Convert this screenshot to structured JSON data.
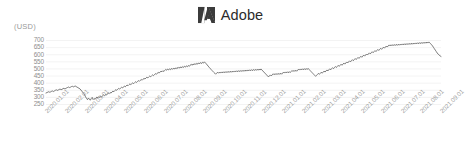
{
  "brand": {
    "logo_icon": "adobe-logo-icon",
    "name": "Adobe",
    "logo_color": "#3b3b3b",
    "text_color": "#2b2b2b"
  },
  "chart_data": {
    "type": "line",
    "title": "Adobe",
    "xlabel": "",
    "ylabel": "(USD)",
    "unit": "(USD)",
    "grid": true,
    "legend": "none",
    "line_color": "#595959",
    "grid_color": "#f0f0f0",
    "ylim": [
      250,
      700
    ],
    "yticks": [
      700,
      650,
      600,
      550,
      500,
      450,
      400,
      350,
      300,
      250
    ],
    "xticks": [
      "2020.01.01",
      "2020.02.01",
      "2020.03.01",
      "2020.04.01",
      "2020.05.01",
      "2020.06.01",
      "2020.07.01",
      "2020.08.01",
      "2020.09.01",
      "2020.10.01",
      "2020.11.01",
      "2020.12.01",
      "2021.01.01",
      "2021.02.01",
      "2021.03.01",
      "2021.04.01",
      "2021.05.01",
      "2021.06.01",
      "2021.07.01",
      "2021.08.01",
      "2021.09.01"
    ],
    "xlim": [
      "2020.01.01",
      "2021.09.30"
    ],
    "series": [
      {
        "name": "ADBE",
        "values": [
          331,
          334,
          337,
          340,
          336,
          339,
          343,
          345,
          341,
          346,
          350,
          353,
          349,
          352,
          356,
          358,
          354,
          357,
          361,
          364,
          360,
          363,
          367,
          370,
          373,
          369,
          372,
          376,
          378,
          374,
          377,
          380,
          376,
          372,
          368,
          364,
          360,
          352,
          344,
          336,
          328,
          316,
          304,
          292,
          284,
          296,
          288,
          280,
          292,
          300,
          285,
          292,
          286,
          295,
          303,
          297,
          305,
          300,
          308,
          303,
          312,
          318,
          312,
          320,
          316,
          324,
          330,
          326,
          334,
          330,
          338,
          344,
          340,
          348,
          354,
          350,
          357,
          363,
          358,
          365,
          371,
          366,
          373,
          379,
          374,
          381,
          387,
          382,
          389,
          395,
          390,
          396,
          402,
          397,
          404,
          410,
          405,
          412,
          418,
          413,
          420,
          426,
          421,
          428,
          434,
          429,
          436,
          442,
          437,
          444,
          450,
          445,
          452,
          458,
          453,
          460,
          467,
          462,
          470,
          476,
          471,
          478,
          485,
          480,
          488,
          482,
          490,
          497,
          491,
          499,
          493,
          501,
          495,
          503,
          497,
          505,
          499,
          507,
          501,
          510,
          504,
          512,
          506,
          515,
          508,
          517,
          511,
          519,
          513,
          522,
          516,
          524,
          518,
          527,
          533,
          526,
          535,
          529,
          538,
          531,
          540,
          534,
          543,
          536,
          545,
          538,
          547,
          541,
          550,
          543,
          536,
          528,
          520,
          512,
          505,
          497,
          490,
          483,
          476,
          470,
          463,
          470,
          477,
          470,
          478,
          471,
          479,
          472,
          480,
          473,
          481,
          474,
          482,
          475,
          483,
          476,
          484,
          477,
          485,
          478,
          486,
          479,
          487,
          480,
          488,
          481,
          489,
          482,
          490,
          483,
          491,
          484,
          492,
          485,
          493,
          486,
          494,
          487,
          495,
          488,
          496,
          489,
          497,
          490,
          498,
          491,
          499,
          492,
          500,
          493,
          486,
          479,
          472,
          465,
          458,
          451,
          444,
          451,
          458,
          451,
          459,
          466,
          459,
          467,
          460,
          468,
          461,
          469,
          462,
          470,
          463,
          471,
          478,
          471,
          479,
          472,
          480,
          473,
          481,
          474,
          482,
          489,
          482,
          490,
          483,
          491,
          484,
          492,
          499,
          492,
          500,
          493,
          501,
          494,
          502,
          495,
          503,
          496,
          504,
          497,
          490,
          483,
          476,
          469,
          462,
          455,
          448,
          455,
          462,
          469,
          462,
          470,
          477,
          470,
          478,
          485,
          478,
          486,
          493,
          486,
          494,
          501,
          494,
          502,
          509,
          502,
          510,
          517,
          510,
          518,
          525,
          518,
          526,
          533,
          526,
          534,
          541,
          534,
          542,
          549,
          542,
          550,
          557,
          550,
          558,
          565,
          558,
          566,
          573,
          566,
          574,
          581,
          574,
          582,
          589,
          582,
          590,
          597,
          590,
          598,
          605,
          598,
          606,
          613,
          606,
          614,
          621,
          614,
          622,
          629,
          622,
          630,
          637,
          630,
          638,
          645,
          638,
          646,
          653,
          646,
          654,
          661,
          654,
          662,
          669,
          662,
          670,
          663,
          671,
          664,
          672,
          665,
          673,
          666,
          674,
          667,
          675,
          668,
          676,
          669,
          677,
          670,
          678,
          671,
          679,
          672,
          680,
          673,
          681,
          674,
          682,
          675,
          683,
          676,
          684,
          677,
          685,
          678,
          686,
          679,
          687,
          680,
          688,
          681,
          689,
          682,
          690,
          683,
          678,
          670,
          662,
          652,
          642,
          632,
          622,
          612,
          604,
          598,
          592,
          588
        ]
      }
    ]
  }
}
